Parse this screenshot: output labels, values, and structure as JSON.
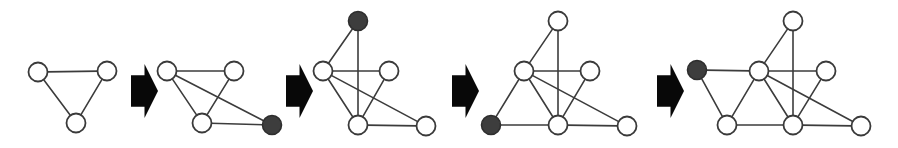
{
  "figure": {
    "canvas": {
      "width": 898,
      "height": 148
    },
    "colors": {
      "background": "#ffffff",
      "edge": "#3c3c3c",
      "node_open_fill": "#ffffff",
      "node_stroke": "#3a3a3a",
      "node_filled_fill": "#3d3d3d",
      "arrow": "#080808"
    },
    "style": {
      "node_radius": 9.5,
      "edge_width": 1.6,
      "node_stroke_width": 1.8
    }
  },
  "steps": [
    {
      "index": 1,
      "name": "step-1-triangle",
      "node_count": 3,
      "edge_count": 3,
      "new_node_id": null,
      "nodes": [
        {
          "id": "a",
          "name": "node-top-left",
          "x": 38,
          "y": 72,
          "state": "open"
        },
        {
          "id": "b",
          "name": "node-top-right",
          "x": 107,
          "y": 71,
          "state": "open"
        },
        {
          "id": "c",
          "name": "node-bottom",
          "x": 76,
          "y": 123,
          "state": "open"
        }
      ],
      "edges": [
        {
          "from": "a",
          "to": "b"
        },
        {
          "from": "a",
          "to": "c"
        },
        {
          "from": "b",
          "to": "c"
        }
      ]
    },
    {
      "index": 2,
      "name": "step-2-add-right-node",
      "node_count": 4,
      "edge_count": 5,
      "new_node_id": "d",
      "nodes": [
        {
          "id": "a",
          "name": "node-top-left",
          "x": 167,
          "y": 71,
          "state": "open"
        },
        {
          "id": "b",
          "name": "node-top-right",
          "x": 234,
          "y": 71,
          "state": "open"
        },
        {
          "id": "c",
          "name": "node-bottom",
          "x": 202,
          "y": 123,
          "state": "open"
        },
        {
          "id": "d",
          "name": "node-new-filled",
          "x": 272,
          "y": 125,
          "state": "filled"
        }
      ],
      "edges": [
        {
          "from": "a",
          "to": "b"
        },
        {
          "from": "a",
          "to": "c"
        },
        {
          "from": "b",
          "to": "c"
        },
        {
          "from": "a",
          "to": "d"
        },
        {
          "from": "c",
          "to": "d"
        }
      ]
    },
    {
      "index": 3,
      "name": "step-3-add-top-node",
      "node_count": 5,
      "edge_count": 7,
      "new_node_id": "e",
      "nodes": [
        {
          "id": "e",
          "name": "node-new-filled",
          "x": 358,
          "y": 21,
          "state": "filled"
        },
        {
          "id": "a",
          "name": "node-mid-left",
          "x": 323,
          "y": 71,
          "state": "open"
        },
        {
          "id": "b",
          "name": "node-mid-right",
          "x": 389,
          "y": 71,
          "state": "open"
        },
        {
          "id": "c",
          "name": "node-bottom-mid",
          "x": 358,
          "y": 125,
          "state": "open"
        },
        {
          "id": "d",
          "name": "node-bottom-right",
          "x": 426,
          "y": 126,
          "state": "open"
        }
      ],
      "edges": [
        {
          "from": "a",
          "to": "b"
        },
        {
          "from": "a",
          "to": "c"
        },
        {
          "from": "b",
          "to": "c"
        },
        {
          "from": "a",
          "to": "d"
        },
        {
          "from": "c",
          "to": "d"
        },
        {
          "from": "e",
          "to": "a"
        },
        {
          "from": "e",
          "to": "c"
        }
      ]
    },
    {
      "index": 4,
      "name": "step-4-add-left-node",
      "node_count": 6,
      "edge_count": 9,
      "new_node_id": "f",
      "nodes": [
        {
          "id": "e",
          "name": "node-top",
          "x": 558,
          "y": 21,
          "state": "open"
        },
        {
          "id": "a",
          "name": "node-mid-left",
          "x": 524,
          "y": 71,
          "state": "open"
        },
        {
          "id": "b",
          "name": "node-mid-right",
          "x": 590,
          "y": 71,
          "state": "open"
        },
        {
          "id": "c",
          "name": "node-bottom-mid",
          "x": 558,
          "y": 125,
          "state": "open"
        },
        {
          "id": "d",
          "name": "node-bottom-right",
          "x": 627,
          "y": 126,
          "state": "open"
        },
        {
          "id": "f",
          "name": "node-new-filled",
          "x": 491,
          "y": 125,
          "state": "filled"
        }
      ],
      "edges": [
        {
          "from": "a",
          "to": "b"
        },
        {
          "from": "a",
          "to": "c"
        },
        {
          "from": "b",
          "to": "c"
        },
        {
          "from": "a",
          "to": "d"
        },
        {
          "from": "c",
          "to": "d"
        },
        {
          "from": "e",
          "to": "a"
        },
        {
          "from": "e",
          "to": "c"
        },
        {
          "from": "f",
          "to": "a"
        },
        {
          "from": "f",
          "to": "c"
        }
      ]
    },
    {
      "index": 5,
      "name": "step-5-add-far-left-node",
      "node_count": 7,
      "edge_count": 11,
      "new_node_id": "g",
      "nodes": [
        {
          "id": "e",
          "name": "node-top",
          "x": 793,
          "y": 21,
          "state": "open"
        },
        {
          "id": "a",
          "name": "node-mid-left",
          "x": 759,
          "y": 71,
          "state": "open"
        },
        {
          "id": "b",
          "name": "node-mid-right",
          "x": 826,
          "y": 71,
          "state": "open"
        },
        {
          "id": "c",
          "name": "node-bottom-mid",
          "x": 793,
          "y": 125,
          "state": "open"
        },
        {
          "id": "d",
          "name": "node-bottom-right",
          "x": 861,
          "y": 126,
          "state": "open"
        },
        {
          "id": "f",
          "name": "node-bottom-left",
          "x": 727,
          "y": 125,
          "state": "open"
        },
        {
          "id": "g",
          "name": "node-new-filled",
          "x": 697,
          "y": 70,
          "state": "filled"
        }
      ],
      "edges": [
        {
          "from": "a",
          "to": "b"
        },
        {
          "from": "a",
          "to": "c"
        },
        {
          "from": "b",
          "to": "c"
        },
        {
          "from": "a",
          "to": "d"
        },
        {
          "from": "c",
          "to": "d"
        },
        {
          "from": "e",
          "to": "a"
        },
        {
          "from": "e",
          "to": "c"
        },
        {
          "from": "f",
          "to": "a"
        },
        {
          "from": "f",
          "to": "c"
        },
        {
          "from": "g",
          "to": "a"
        },
        {
          "from": "g",
          "to": "f"
        }
      ]
    }
  ],
  "arrows": [
    {
      "index": 1,
      "name": "step-arrow-1",
      "x": 131,
      "y": 64,
      "width": 27,
      "height": 54
    },
    {
      "index": 2,
      "name": "step-arrow-2",
      "x": 286,
      "y": 64,
      "width": 27,
      "height": 54
    },
    {
      "index": 3,
      "name": "step-arrow-3",
      "x": 452,
      "y": 64,
      "width": 27,
      "height": 54
    },
    {
      "index": 4,
      "name": "step-arrow-4",
      "x": 657,
      "y": 64,
      "width": 27,
      "height": 54
    }
  ]
}
